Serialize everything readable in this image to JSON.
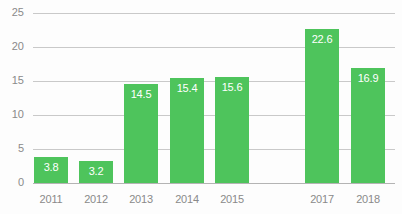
{
  "chart_data": {
    "type": "bar",
    "title": "",
    "subtitle": "",
    "xlabel": "",
    "ylabel": "",
    "categories": [
      "2011",
      "2012",
      "2013",
      "2014",
      "2015",
      "2016",
      "2017",
      "2018"
    ],
    "values": [
      3.8,
      3.2,
      14.5,
      15.4,
      15.6,
      null,
      22.6,
      16.9
    ],
    "value_labels": [
      "3.8",
      "3.2",
      "14.5",
      "15.4",
      "15.6",
      "",
      "22.6",
      "16.9"
    ],
    "ylim": [
      0,
      25
    ],
    "yticks": [
      0,
      5,
      10,
      15,
      20,
      25
    ],
    "ytick_labels": [
      "0",
      "5",
      "10",
      "15",
      "20",
      "25"
    ],
    "grid": true,
    "grid_axis": "y",
    "legend": "none",
    "bar_color": "#4ec45c",
    "value_label_color": "#ffffff",
    "grid_color": "#c9c9c9",
    "axis_text_color": "#8a8a8a",
    "background_color": "#fdfdfd"
  }
}
